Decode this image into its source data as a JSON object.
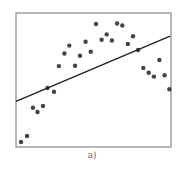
{
  "chart_data": {
    "type": "scatter",
    "title": "",
    "caption": "a)",
    "xlabel": "",
    "ylabel": "",
    "xlim": [
      0,
      100
    ],
    "ylim": [
      0,
      100
    ],
    "grid": false,
    "legend": null,
    "series": [
      {
        "name": "points",
        "kind": "scatter",
        "color": "#444444",
        "x": [
          3.2,
          7.1,
          11.0,
          13.9,
          17.4,
          20.3,
          24.5,
          27.7,
          31.2,
          34.4,
          38.1,
          41.3,
          44.9,
          48.2,
          51.6,
          55.2,
          58.5,
          61.9,
          65.2,
          68.6,
          72.1,
          75.5,
          78.8,
          82.1,
          85.6,
          89.0,
          92.5,
          95.9,
          99.0
        ],
        "y": [
          3.7,
          8.2,
          29.3,
          26.1,
          30.6,
          44.0,
          41.3,
          60.4,
          69.8,
          75.7,
          60.7,
          68.1,
          78.6,
          71.1,
          91.8,
          80.1,
          84.0,
          79.5,
          92.2,
          90.7,
          76.9,
          82.7,
          72.4,
          59.0,
          55.4,
          52.5,
          64.9,
          53.5,
          43.1
        ]
      },
      {
        "name": "linear fit",
        "kind": "line",
        "color": "#222222",
        "x": [
          0,
          99.4
        ],
        "y": [
          34.0,
          82.8
        ]
      }
    ]
  },
  "layout": {
    "frame": {
      "left": 16,
      "top": 13,
      "right": 171,
      "bottom": 147
    },
    "frame_color": "#888888",
    "dot_radius": 2.2
  }
}
